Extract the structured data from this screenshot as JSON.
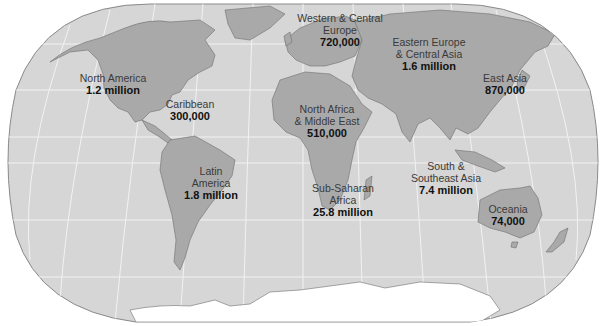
{
  "map": {
    "type": "world-choropleth",
    "projection": "Robinson",
    "colors": {
      "ocean": "#d6d6d6",
      "land": "#a9a9a9",
      "land_border": "#6e6e6e",
      "graticule": "#f2f2f2",
      "antarctica": "#ffffff",
      "frame": "#8a8a8a"
    }
  },
  "regions": [
    {
      "name": "North America",
      "value": "1.2 million",
      "x": 113,
      "y": 73
    },
    {
      "name": "Caribbean",
      "value": "300,000",
      "x": 190,
      "y": 99
    },
    {
      "name": "Latin America",
      "value": "1.8 million",
      "x": 211,
      "y": 166
    },
    {
      "name": "Western & Central Europe",
      "value": "720,000",
      "x": 340,
      "y": 12
    },
    {
      "name": "Eastern Europe & Central Asia",
      "value": "1.6 million",
      "x": 429,
      "y": 37
    },
    {
      "name": "North Africa & Middle East",
      "value": "510,000",
      "x": 327,
      "y": 104
    },
    {
      "name": "Sub-Saharan Africa",
      "value": "25.8 million",
      "x": 343,
      "y": 183
    },
    {
      "name": "East Asia",
      "value": "870,000",
      "x": 505,
      "y": 72
    },
    {
      "name": "South & Southeast Asia",
      "value": "7.4 million",
      "x": 446,
      "y": 172
    },
    {
      "name": "Oceania",
      "value": "74,000",
      "x": 508,
      "y": 205
    }
  ],
  "labels": {
    "north_america": {
      "name": "North America",
      "value": "1.2 million"
    },
    "caribbean": {
      "name": "Caribbean",
      "value": "300,000"
    },
    "latin_america_1": "Latin",
    "latin_america_2": "America",
    "latin_america_value": "1.8 million",
    "west_europe_1": "Western & Central",
    "west_europe_2": "Europe",
    "west_europe_value": "720,000",
    "east_europe_1": "Eastern Europe",
    "east_europe_2": "& Central Asia",
    "east_europe_value": "1.6 million",
    "north_africa_1": "North Africa",
    "north_africa_2": "& Middle East",
    "north_africa_value": "510,000",
    "ssa_1": "Sub-Saharan",
    "ssa_2": "Africa",
    "ssa_value": "25.8 million",
    "east_asia": {
      "name": "East Asia",
      "value": "870,000"
    },
    "south_asia_1": "South &",
    "south_asia_2": "Southeast Asia",
    "south_asia_value": "7.4 million",
    "oceania": {
      "name": "Oceania",
      "value": "74,000"
    }
  }
}
